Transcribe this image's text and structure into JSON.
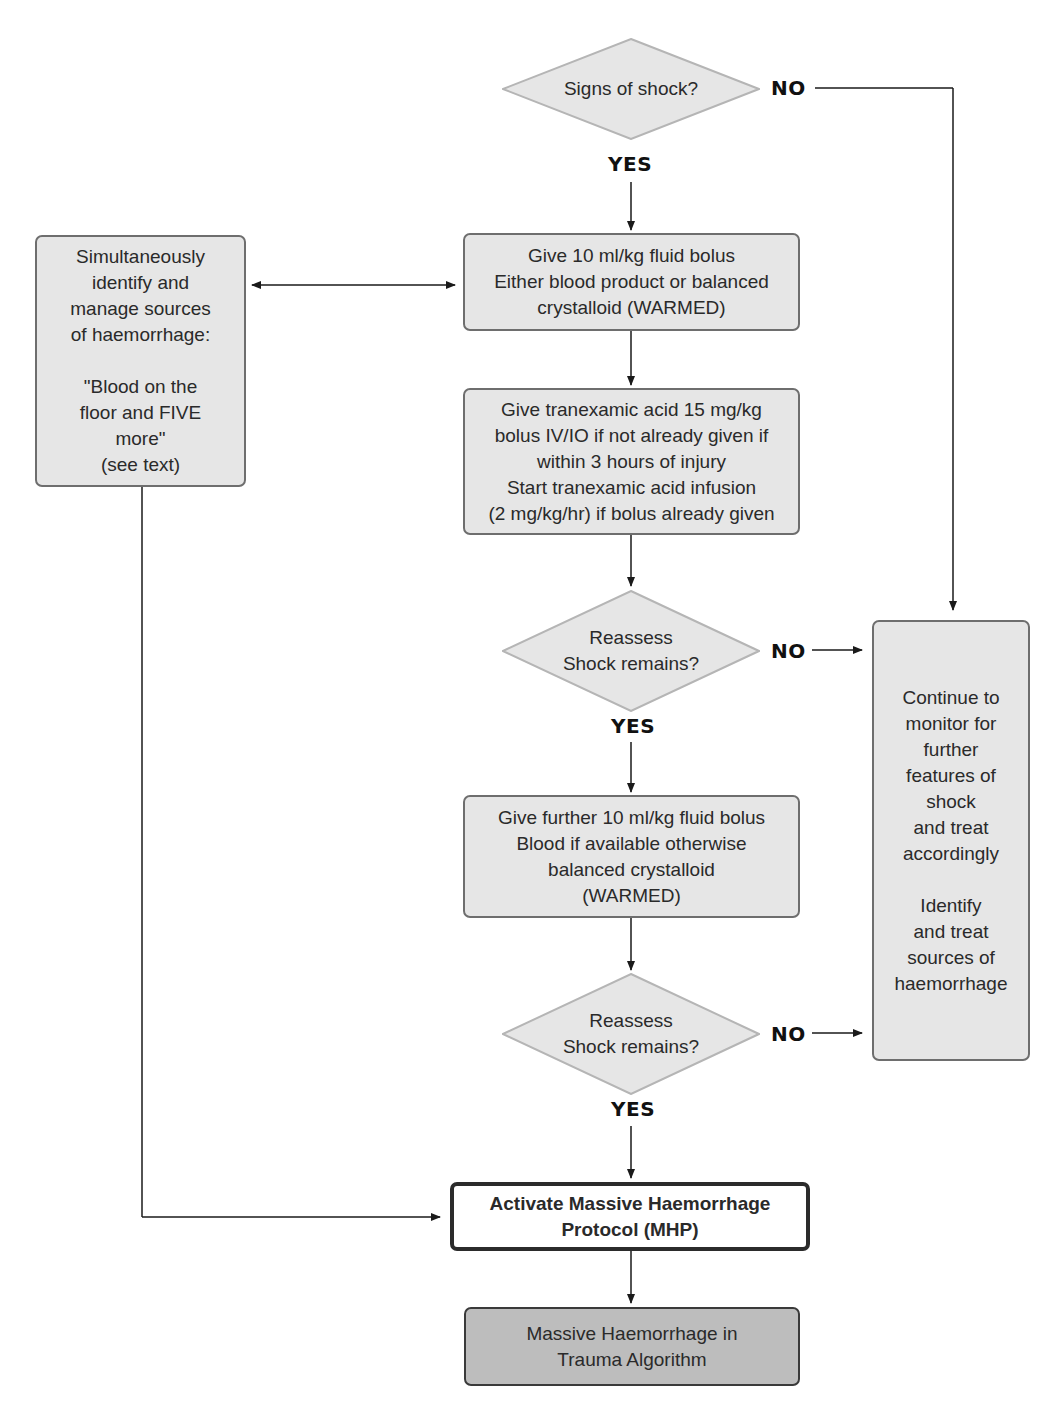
{
  "diagram": {
    "type": "clinical-flowchart",
    "nodes": {
      "signs_of_shock": {
        "shape": "diamond",
        "text": "Signs of shock?"
      },
      "fluid_bolus_1": {
        "shape": "box",
        "text": "Give 10 ml/kg fluid bolus\nEither blood product or balanced\ncrystalloid (WARMED)"
      },
      "tranexamic": {
        "shape": "box",
        "text": "Give tranexamic acid 15 mg/kg\nbolus IV/IO if not already given if\nwithin 3 hours of injury\nStart tranexamic acid infusion\n(2 mg/kg/hr) if bolus already given"
      },
      "reassess_1": {
        "shape": "diamond",
        "text": "Reassess\nShock remains?"
      },
      "fluid_bolus_2": {
        "shape": "box",
        "text": "Give further 10 ml/kg fluid bolus\nBlood if available otherwise\nbalanced crystalloid\n(WARMED)"
      },
      "reassess_2": {
        "shape": "diamond",
        "text": "Reassess\nShock remains?"
      },
      "mhp": {
        "shape": "box-bold",
        "text": "Activate Massive Haemorrhage\nProtocol (MHP)"
      },
      "algorithm": {
        "shape": "box-dark",
        "text": "Massive Haemorrhage in\nTrauma Algorithm"
      },
      "haemorrhage_sources": {
        "shape": "box",
        "text": "Simultaneously\nidentify and\nmanage sources\nof haemorrhage:\n\n\"Blood on the\nfloor and FIVE\nmore\"\n(see text)"
      },
      "monitor": {
        "shape": "box",
        "text": "Continue to\nmonitor for\nfurther\nfeatures of\nshock\nand treat\naccordingly\n\nIdentify\nand treat\nsources of\nhaemorrhage"
      }
    },
    "labels": {
      "yes": "YES",
      "no": "NO"
    },
    "colors": {
      "box_fill": "#e6e6e6",
      "box_border": "#6e6e6e",
      "final_fill": "#bdbdbd",
      "mhp_border": "#2b2b2b",
      "line": "#1a1a1a"
    }
  }
}
